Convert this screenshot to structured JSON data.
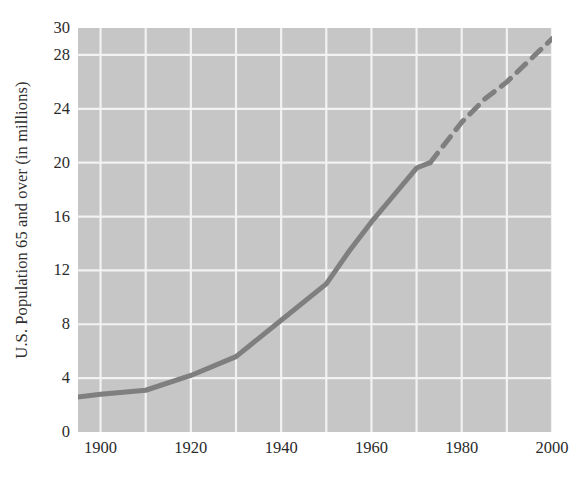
{
  "figure": {
    "background_color": "#ffffff",
    "plot_background_color": "#c6c6c6",
    "grid_color": "#f2f2f2",
    "line_color": "#7f7f7f",
    "text_color": "#2b2b2b"
  },
  "chart_data": {
    "type": "line",
    "title": "",
    "xlabel": "",
    "ylabel": "U.S. Population 65 and over (in millions)",
    "xlim": [
      1895,
      2000
    ],
    "ylim": [
      0,
      30
    ],
    "xticks": [
      1900,
      1920,
      1940,
      1960,
      1980,
      2000
    ],
    "xticklabels": [
      "1900",
      "1920",
      "1940",
      "1960",
      "1980",
      "2000"
    ],
    "yticks": [
      0,
      4,
      8,
      12,
      16,
      20,
      24,
      28,
      30
    ],
    "yticklabels": [
      "0",
      "4",
      "8",
      "12",
      "16",
      "20",
      "24",
      "28",
      "30"
    ],
    "grid": {
      "visible": true,
      "x_major_step": 20,
      "x_minor_step": 10,
      "y_major_step": 4,
      "color": "#f2f2f2"
    },
    "legend": {
      "visible": false
    },
    "series": [
      {
        "name": "Actual (solid)",
        "style": "solid",
        "color": "#7f7f7f",
        "x": [
          1895,
          1900,
          1910,
          1920,
          1930,
          1940,
          1950,
          1955,
          1960,
          1965,
          1970,
          1973
        ],
        "values": [
          2.6,
          2.8,
          3.1,
          4.2,
          5.6,
          8.3,
          11.0,
          13.4,
          15.6,
          17.6,
          19.6,
          20.0
        ]
      },
      {
        "name": "Projected (dashed)",
        "style": "dashed",
        "color": "#7f7f7f",
        "x": [
          1973,
          1980,
          1985,
          1990,
          1995,
          2000
        ],
        "values": [
          20.0,
          23.0,
          24.7,
          26.0,
          27.6,
          29.2
        ]
      }
    ],
    "annotations": [
      {
        "text": "Solid line indicates recorded data through about 1973",
        "visible": false
      },
      {
        "text": "Dashed line indicates projection from about 1973 to 2000",
        "visible": false
      }
    ]
  }
}
